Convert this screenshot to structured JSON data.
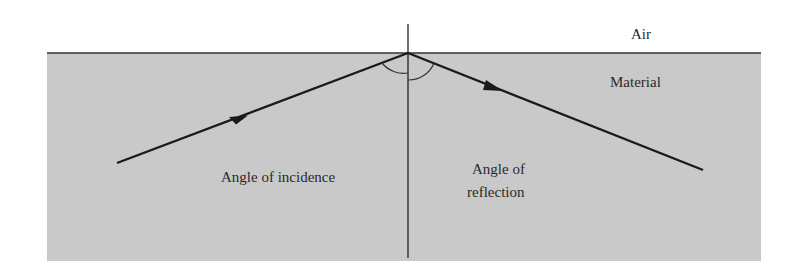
{
  "diagram": {
    "type": "reflection",
    "colors": {
      "background": "#ffffff",
      "material": "#c9c9c9",
      "line": "#1a1a1a",
      "text": "#2a2a2a"
    },
    "labels": {
      "air": "Air",
      "material": "Material",
      "incidence": "Angle of incidence",
      "reflection_line1": "Angle of",
      "reflection_line2": "reflection"
    },
    "geometry": {
      "material_rect": {
        "x": 47,
        "y": 53,
        "w": 714,
        "h": 208
      },
      "surface_y": 53,
      "point_of_incidence": {
        "x": 408,
        "y": 53
      },
      "normal": {
        "x": 408,
        "y1": 24,
        "y2": 258
      },
      "incident_ray": {
        "x1": 117,
        "y1": 163,
        "x2": 408,
        "y2": 53
      },
      "reflected_ray": {
        "x1": 408,
        "y1": 53,
        "x2": 703,
        "y2": 170
      }
    }
  }
}
